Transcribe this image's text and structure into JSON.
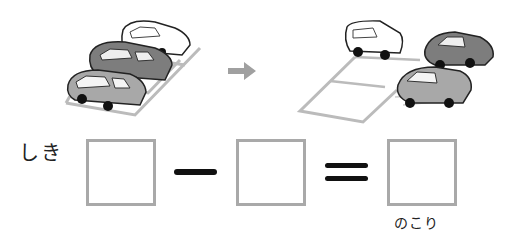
{
  "illustration": {
    "before": {
      "description": "three cars parked side by side in parking spaces",
      "cars": [
        "white car",
        "dark gray car",
        "light gray car"
      ]
    },
    "arrow": {
      "icon": "right-arrow-icon",
      "color": "#a0a0a0"
    },
    "after": {
      "description": "one white car remains parked; two cars drive away",
      "cars_remaining": [
        "white car"
      ],
      "cars_leaving": [
        "dark gray car",
        "light gray car"
      ]
    }
  },
  "equation": {
    "label": "しき",
    "operator_minus": "minus",
    "operator_equals": "equals",
    "boxes": [
      {
        "value": ""
      },
      {
        "value": ""
      },
      {
        "value": "",
        "caption": "のこり"
      }
    ],
    "box_border_color": "#a9a9a9"
  }
}
